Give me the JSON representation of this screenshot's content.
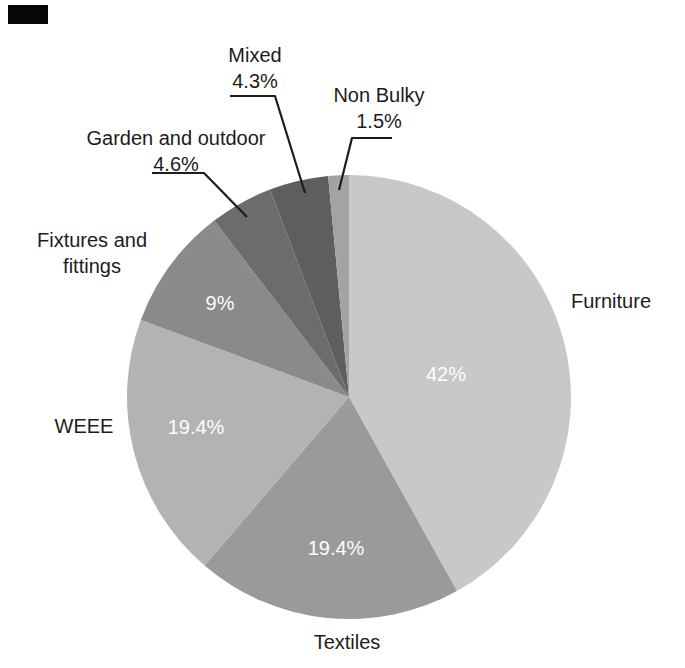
{
  "figure": {
    "background_color": "#ffffff",
    "text_color": "#1c1c1c",
    "inside_label_color": "#fdfdfd"
  },
  "chart_data": {
    "type": "pie",
    "title": "",
    "unit": "%",
    "total_percent": 100.2,
    "slices": [
      {
        "name": "Furniture",
        "value": 42,
        "value_label": "42%",
        "color": "#c8c8c8",
        "label_position": "outside-right",
        "value_label_position": "inside"
      },
      {
        "name": "Textiles",
        "value": 19.4,
        "value_label": "19.4%",
        "color": "#9a9a9a",
        "label_position": "outside-bottom",
        "value_label_position": "inside"
      },
      {
        "name": "WEEE",
        "value": 19.4,
        "value_label": "19.4%",
        "color": "#b3b3b3",
        "label_position": "outside-left",
        "value_label_position": "inside"
      },
      {
        "name": "Fixtures and fittings",
        "value": 9,
        "value_label": "9%",
        "color": "#8a8a8a",
        "label_position": "outside-upper-left",
        "value_label_position": "inside"
      },
      {
        "name": "Garden and outdoor",
        "value": 4.6,
        "value_label": "4.6%",
        "color": "#6c6c6c",
        "label_position": "outside-top-with-leader",
        "value_label_position": "with-name"
      },
      {
        "name": "Mixed",
        "value": 4.3,
        "value_label": "4.3%",
        "color": "#5e5e5e",
        "label_position": "outside-top-with-leader",
        "value_label_position": "with-name"
      },
      {
        "name": "Non Bulky",
        "value": 1.5,
        "value_label": "1.5%",
        "color": "#a3a3a3",
        "label_position": "outside-top-with-leader",
        "value_label_position": "with-name"
      }
    ],
    "layout_hints": {
      "start_angle_deg": 0,
      "direction": "clockwise",
      "start_position": "12-o-clock",
      "legend": "none",
      "small_slices_use_leader_lines": true,
      "large_slice_percentages_inside": true
    }
  }
}
